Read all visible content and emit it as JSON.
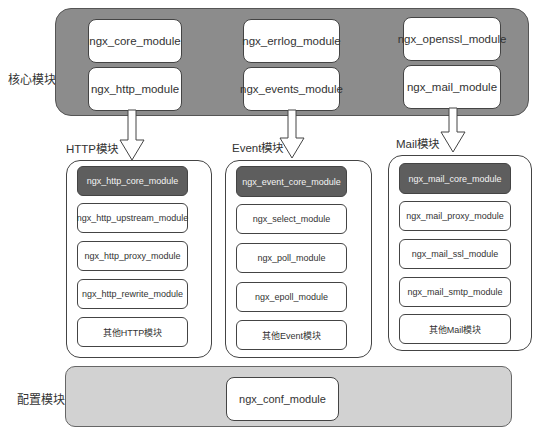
{
  "core": {
    "label": "核心模块",
    "modules": [
      [
        "ngx_core_module",
        "ngx_http_module"
      ],
      [
        "ngx_errlog_module",
        "ngx_events_module"
      ],
      [
        "ngx_openssl_module",
        "ngx_mail_module"
      ]
    ]
  },
  "groups": [
    {
      "label": "HTTP模块",
      "modules": [
        "ngx_http_core_module",
        "ngx_http_upstream_module",
        "ngx_http_proxy_module",
        "ngx_http_rewrite_module",
        "其他HTTP模块"
      ]
    },
    {
      "label": "Event模块",
      "modules": [
        "ngx_event_core_module",
        "ngx_select_module",
        "ngx_poll_module",
        "ngx_epoll_module",
        "其他Event模块"
      ]
    },
    {
      "label": "Mail模块",
      "modules": [
        "ngx_mail_core_module",
        "ngx_mail_proxy_module",
        "ngx_mail_ssl_module",
        "ngx_mail_smtp_module",
        "其他Mail模块"
      ]
    }
  ],
  "config": {
    "label": "配置模块",
    "module": "ngx_conf_module"
  },
  "colors": {
    "core_panel": "#8c8c8c",
    "config_panel": "#d2d2d2",
    "core_submodule": "#5e5e5e"
  }
}
